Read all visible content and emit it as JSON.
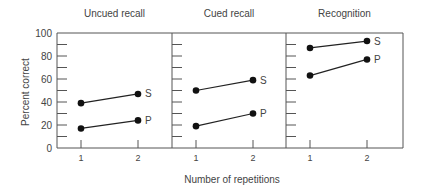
{
  "chart_data": {
    "type": "line",
    "ylabel": "Percent correct",
    "xlabel": "Number of repetitions",
    "ylim": [
      0,
      100
    ],
    "yticks": [
      0,
      20,
      40,
      60,
      80,
      100
    ],
    "x": [
      1,
      2
    ],
    "xtick_labels": [
      "1",
      "2"
    ],
    "grid": false,
    "legend": "inline labels at line ends",
    "panels": [
      {
        "title": "Uncued recall",
        "series": [
          {
            "name": "S",
            "values": [
              39,
              47
            ]
          },
          {
            "name": "P",
            "values": [
              17,
              24
            ]
          }
        ]
      },
      {
        "title": "Cued recall",
        "series": [
          {
            "name": "S",
            "values": [
              50,
              59
            ]
          },
          {
            "name": "P",
            "values": [
              19,
              30
            ]
          }
        ]
      },
      {
        "title": "Recognition",
        "series": [
          {
            "name": "S",
            "values": [
              87,
              93
            ]
          },
          {
            "name": "P",
            "values": [
              63,
              77
            ]
          }
        ]
      }
    ]
  },
  "colors": {
    "axis": "#555555",
    "line": "#222222",
    "marker": "#111111",
    "text": "#444444"
  }
}
